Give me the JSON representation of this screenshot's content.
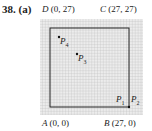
{
  "problem": {
    "number": "38.",
    "part": "(a)"
  },
  "labels": {
    "D": {
      "name": "D",
      "coords": "(0, 27)"
    },
    "C": {
      "name": "C",
      "coords": "(27, 27)"
    },
    "A": {
      "name": "A",
      "coords": "(0, 0)"
    },
    "B": {
      "name": "B",
      "coords": "(27, 0)"
    },
    "P1": "P",
    "P1_sub": "1",
    "P2": "P",
    "P2_sub": "2",
    "P3": "P",
    "P3_sub": "3",
    "P4": "P",
    "P4_sub": "4"
  },
  "colors": {
    "grid": "#b8b8b8",
    "grid_bg": "#e8e8e8",
    "square": "#222222"
  }
}
